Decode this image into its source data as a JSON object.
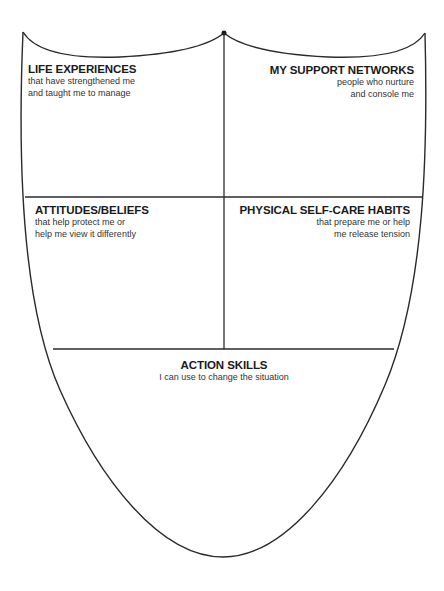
{
  "diagram": {
    "type": "coping-shield",
    "stroke_color": "#2a2a2a",
    "background": "#ffffff",
    "sections": [
      {
        "id": "life-experiences",
        "title": "LIFE EXPERIENCES",
        "subtitle_lines": [
          "that have strengthened me",
          "and taught me to manage"
        ]
      },
      {
        "id": "support-networks",
        "title": "MY SUPPORT NETWORKS",
        "subtitle_lines": [
          "people who nurture",
          "and console me"
        ]
      },
      {
        "id": "attitudes-beliefs",
        "title": "ATTITUDES/BELIEFS",
        "subtitle_lines": [
          "that help protect me or",
          "help me view it differently"
        ]
      },
      {
        "id": "self-care-habits",
        "title": "PHYSICAL SELF-CARE HABITS",
        "subtitle_lines": [
          "that prepare me or help",
          "me release tension"
        ]
      },
      {
        "id": "action-skills",
        "title": "ACTION SKILLS",
        "subtitle_lines": [
          "I can use to change the situation"
        ]
      }
    ]
  }
}
